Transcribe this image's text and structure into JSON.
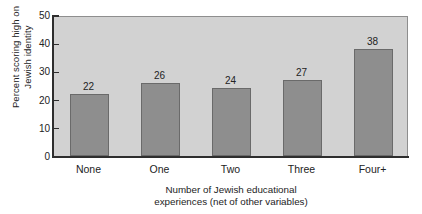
{
  "chart_data": {
    "type": "bar",
    "title": "",
    "subtitle": "",
    "xlabel_lines": [
      "Number of Jewish educational",
      "experiences (net of other variables)"
    ],
    "ylabel_lines": [
      "Percent scoring high on",
      "Jewish identity"
    ],
    "categories": [
      "None",
      "One",
      "Two",
      "Three",
      "Four+"
    ],
    "values": [
      22,
      26,
      24,
      27,
      38
    ],
    "data_labels": [
      "22",
      "26",
      "24",
      "27",
      "38"
    ],
    "ylim": [
      0,
      50
    ],
    "yticks": [
      0,
      10,
      20,
      30,
      40,
      50
    ],
    "ytick_labels": [
      "0",
      "10",
      "20",
      "30",
      "40",
      "50"
    ],
    "grid": false,
    "legend": null,
    "colors": {
      "bar_fill": "#8e8e8e",
      "bar_edge": "#6a6a6a",
      "plot_background": "#d2d2d2",
      "plot_border": "#8e8e8e",
      "axis": "#2e2e2e",
      "text": "#232323",
      "page_background": "#ffffff"
    }
  }
}
